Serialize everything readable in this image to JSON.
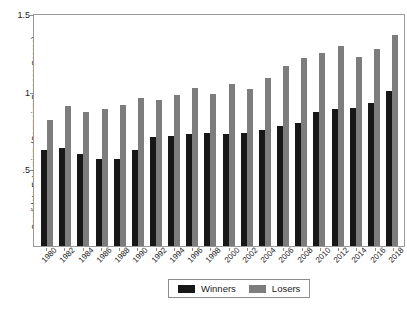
{
  "chart_data": {
    "type": "bar",
    "title": "",
    "xlabel": "",
    "ylabel": "Candidate Extremism (Campaign Finance Scores)",
    "ylim": [
      0,
      1.5
    ],
    "yticks": [
      "0",
      ".5",
      "1",
      "1.5"
    ],
    "ytick_values": [
      0,
      0.5,
      1,
      1.5
    ],
    "grid": false,
    "legend_position": "bottom-center",
    "categories": [
      "1980",
      "1982",
      "1984",
      "1986",
      "1988",
      "1990",
      "1992",
      "1994",
      "1996",
      "1998",
      "2000",
      "2002",
      "2004",
      "2006",
      "2008",
      "2010",
      "2012",
      "2014",
      "2016",
      "2018"
    ],
    "series": [
      {
        "name": "Winners",
        "color": "#171717",
        "values": [
          0.62,
          0.63,
          0.59,
          0.56,
          0.56,
          0.62,
          0.7,
          0.71,
          0.72,
          0.73,
          0.72,
          0.73,
          0.75,
          0.77,
          0.79,
          0.86,
          0.88,
          0.89,
          0.92,
          1.0
        ]
      },
      {
        "name": "Losers",
        "color": "#7d7d7d",
        "values": [
          0.81,
          0.9,
          0.86,
          0.88,
          0.91,
          0.95,
          0.94,
          0.97,
          1.02,
          0.98,
          1.04,
          1.01,
          1.08,
          1.16,
          1.21,
          1.24,
          1.29,
          1.22,
          1.27,
          1.36
        ]
      }
    ]
  },
  "ylabel": {
    "text": "Candidate Extremism (Campaign Finance Scores)"
  },
  "legend": {
    "items": [
      {
        "label": "Winners",
        "color": "#171717"
      },
      {
        "label": "Losers",
        "color": "#7d7d7d"
      }
    ]
  },
  "caption": {
    "text": ""
  }
}
